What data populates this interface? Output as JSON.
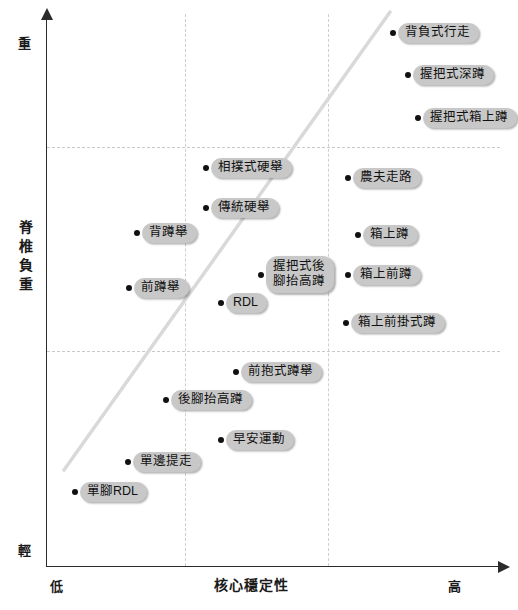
{
  "chart_data": {
    "type": "scatter",
    "title": "",
    "xlabel": "核心穩定性",
    "ylabel": "脊椎負重",
    "x_axis": {
      "title": "核心穩定性",
      "low_label": "低",
      "high_label": "高",
      "gridlines": [
        185,
        328
      ]
    },
    "y_axis": {
      "title": "脊椎負重",
      "high_label": "重",
      "low_label": "輕",
      "gridlines": [
        147,
        351
      ]
    },
    "grid": true,
    "legend": "none",
    "trend_line": {
      "style": "solid",
      "color": "#d9d9d9",
      "x1": 64,
      "y1": 470,
      "x2": 390,
      "y2": 12
    },
    "points": [
      {
        "label": "背負式行走",
        "x": 390,
        "y": 33,
        "lines": 1
      },
      {
        "label": "握把式深蹲",
        "x": 405,
        "y": 75,
        "lines": 1
      },
      {
        "label": "握把式箱上蹲",
        "x": 415,
        "y": 118,
        "lines": 1
      },
      {
        "label": "相撲式硬舉",
        "x": 203,
        "y": 168,
        "lines": 1
      },
      {
        "label": "農夫走路",
        "x": 345,
        "y": 178,
        "lines": 1
      },
      {
        "label": "傳統硬舉",
        "x": 203,
        "y": 208,
        "lines": 1
      },
      {
        "label": "背蹲舉",
        "x": 134,
        "y": 233,
        "lines": 1
      },
      {
        "label": "箱上蹲",
        "x": 355,
        "y": 235,
        "lines": 1
      },
      {
        "label": "握把式後\n腳抬高蹲",
        "x": 258,
        "y": 275,
        "lines": 2
      },
      {
        "label": "箱上前蹲",
        "x": 345,
        "y": 275,
        "lines": 1
      },
      {
        "label": "前蹲舉",
        "x": 126,
        "y": 288,
        "lines": 1
      },
      {
        "label": "RDL",
        "x": 218,
        "y": 303,
        "lines": 1
      },
      {
        "label": "箱上前掛式蹲",
        "x": 343,
        "y": 323,
        "lines": 1
      },
      {
        "label": "前抱式蹲舉",
        "x": 233,
        "y": 372,
        "lines": 1
      },
      {
        "label": "後腳抬高蹲",
        "x": 163,
        "y": 400,
        "lines": 1
      },
      {
        "label": "早安運動",
        "x": 218,
        "y": 440,
        "lines": 1
      },
      {
        "label": "單邊提走",
        "x": 125,
        "y": 462,
        "lines": 1
      },
      {
        "label": "單腳RDL",
        "x": 72,
        "y": 492,
        "lines": 1
      }
    ],
    "colors": {
      "axis": "#2b2b2b",
      "grid": "#c9c9c9",
      "dot": "#111111",
      "pill_bg": "#c8c8c8",
      "pill_text": "#111111",
      "trend": "#d9d9d9",
      "background": "#ffffff"
    }
  }
}
